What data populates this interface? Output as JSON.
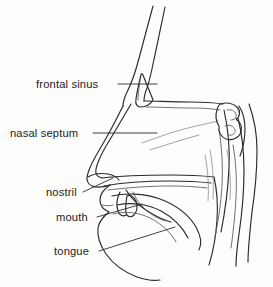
{
  "figure": {
    "title": "Sagittal section of the human head showing the nasal and oral airway",
    "type": "anatomical-line-diagram",
    "background_color": "#fdfdfc",
    "line_color": "#2b2b2b",
    "text_color": "#1b1b1b"
  },
  "labels": [
    {
      "id": "frontal-sinus",
      "text": "frontal sinus",
      "text_x": 36,
      "text_y": 88,
      "anchor": "start",
      "leader": "M118,84 L157,84"
    },
    {
      "id": "nasal-septum",
      "text": "nasal septum",
      "text_x": 10,
      "text_y": 137,
      "anchor": "start",
      "leader": "M93,133 L157,133"
    },
    {
      "id": "nostril",
      "text": "nostril",
      "text_x": 46,
      "text_y": 196,
      "anchor": "start",
      "leader": "M83,192 L113,178"
    },
    {
      "id": "mouth",
      "text": "mouth",
      "text_x": 56,
      "text_y": 221,
      "anchor": "start",
      "leader": "M97,217 L142,204"
    },
    {
      "id": "tongue",
      "text": "tongue",
      "text_x": 54,
      "text_y": 255,
      "anchor": "start",
      "leader": "M99,251 L175,227"
    }
  ],
  "structures": [
    {
      "id": "forehead-outer",
      "role": "forehead and nose bridge outer contour"
    },
    {
      "id": "forehead-inner",
      "role": "inner skull table of the frontal bone"
    },
    {
      "id": "nose-profile",
      "role": "external nose profile down to the tip"
    },
    {
      "id": "frontal-sinus-cavity",
      "role": "frontal sinus air cavity"
    },
    {
      "id": "nasal-cavity",
      "role": "nasal cavity outline"
    },
    {
      "id": "nasal-septum-line",
      "role": "nasal septum surface"
    },
    {
      "id": "hard-palate",
      "role": "hard palate separating nose and mouth"
    },
    {
      "id": "soft-palate-uvula",
      "role": "soft palate and uvula"
    },
    {
      "id": "tongue-body",
      "role": "tongue"
    },
    {
      "id": "lips-chin",
      "role": "lips, jaw and chin contour"
    },
    {
      "id": "pharynx",
      "role": "pharyngeal airway"
    },
    {
      "id": "sphenoid-region",
      "role": "sphenoid sinus and skull base"
    },
    {
      "id": "neck-spine",
      "role": "posterior neck and cervical spine"
    }
  ]
}
